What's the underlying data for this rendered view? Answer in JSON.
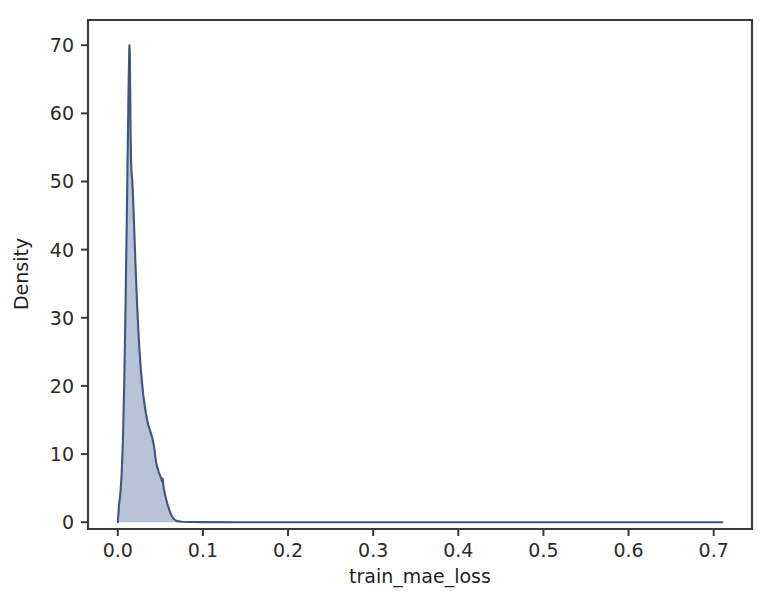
{
  "figure": {
    "background_color": "#ffffff",
    "width": 765,
    "height": 609
  },
  "chart_data": {
    "type": "area",
    "subtype": "kde-density-curve",
    "title": "",
    "xlabel": "train_mae_loss",
    "ylabel": "Density",
    "xlim": [
      -0.035,
      0.745
    ],
    "ylim": [
      -1.0,
      73.7
    ],
    "grid": false,
    "legend": null,
    "legend_position": "none",
    "xticks": [
      0.0,
      0.1,
      0.2,
      0.3,
      0.4,
      0.5,
      0.6,
      0.7
    ],
    "xtick_labels": [
      "0.0",
      "0.1",
      "0.2",
      "0.3",
      "0.4",
      "0.5",
      "0.6",
      "0.7"
    ],
    "yticks": [
      0,
      10,
      20,
      30,
      40,
      50,
      60,
      70
    ],
    "ytick_labels": [
      "0",
      "10",
      "20",
      "30",
      "40",
      "50",
      "60",
      "70"
    ],
    "series": [
      {
        "name": "train_mae_loss density",
        "fill_color": "#aab8d0",
        "fill_opacity": 0.85,
        "line_color": "#41557f",
        "line_width": 2.1,
        "x": [
          0.0,
          0.0015,
          0.003,
          0.0045,
          0.006,
          0.0075,
          0.009,
          0.0105,
          0.0118,
          0.0128,
          0.0136,
          0.0141,
          0.0145,
          0.015,
          0.0156,
          0.0162,
          0.017,
          0.018,
          0.019,
          0.02,
          0.0212,
          0.0225,
          0.024,
          0.0255,
          0.027,
          0.0285,
          0.03,
          0.0315,
          0.033,
          0.0345,
          0.036,
          0.0375,
          0.039,
          0.0405,
          0.042,
          0.0432,
          0.044,
          0.0452,
          0.0465,
          0.048,
          0.0495,
          0.051,
          0.052,
          0.0528,
          0.0534,
          0.0545,
          0.0558,
          0.057,
          0.0582,
          0.0595,
          0.0608,
          0.062,
          0.0635,
          0.065,
          0.0665,
          0.068,
          0.07,
          0.075,
          0.085,
          0.1,
          0.15,
          0.2,
          0.3,
          0.4,
          0.5,
          0.6,
          0.68,
          0.71
        ],
        "y": [
          0.0,
          2.6,
          4.2,
          7.0,
          12.0,
          20.0,
          31.0,
          44.0,
          56.0,
          65.0,
          70.0,
          69.0,
          64.0,
          57.5,
          53.0,
          51.2,
          50.2,
          47.5,
          44.0,
          40.5,
          36.5,
          32.5,
          28.5,
          25.2,
          22.5,
          20.4,
          18.6,
          17.2,
          16.0,
          15.0,
          14.2,
          13.6,
          13.0,
          12.4,
          11.5,
          10.6,
          9.6,
          8.7,
          8.0,
          7.4,
          6.9,
          6.4,
          6.0,
          6.4,
          5.6,
          4.6,
          3.9,
          3.3,
          2.7,
          2.2,
          1.7,
          1.3,
          0.9,
          0.6,
          0.4,
          0.25,
          0.15,
          0.06,
          0.02,
          0.01,
          0.0,
          0.0,
          0.0,
          0.0,
          0.0,
          0.0,
          0.0,
          0.0
        ],
        "peak_x": 0.0136,
        "peak_y": 70.0,
        "support_end": 0.71
      }
    ]
  },
  "axes": {
    "spine_color": "#3a3a3a",
    "tick_color": "#3a3a3a",
    "label_color": "#2b2b2b"
  }
}
